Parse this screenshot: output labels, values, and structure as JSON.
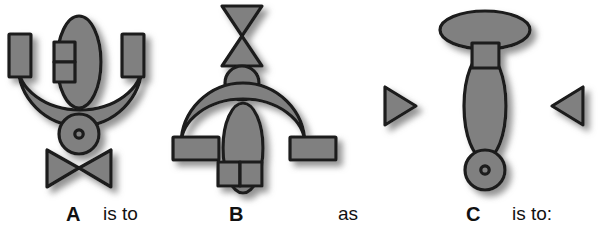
{
  "page": {
    "background_color": "#ffffff"
  },
  "style": {
    "shape_fill": "#808080",
    "shape_stroke": "#1a1a1a",
    "shadow_color": "#9a9a9a",
    "text_color": "#111111"
  },
  "captions": {
    "label_a": "A",
    "is_to_1": "is to",
    "label_b": "B",
    "as": "as",
    "label_c": "C",
    "is_to_2": "is to:"
  },
  "figures": [
    {
      "id": "A",
      "label": "A",
      "orientation": "upright",
      "parts": [
        {
          "name": "left-rectangle",
          "shape": "rectangle",
          "position": "upper-left"
        },
        {
          "name": "center-double-rectangle",
          "shape": "stacked-rectangles",
          "position": "upper-center-left",
          "count": 2
        },
        {
          "name": "vertical-ellipse",
          "shape": "ellipse",
          "position": "center",
          "orientation": "vertical"
        },
        {
          "name": "right-rectangle",
          "shape": "rectangle",
          "position": "upper-right"
        },
        {
          "name": "crescent-bowl",
          "shape": "crescent",
          "position": "middle",
          "opening": "up"
        },
        {
          "name": "ringed-circle",
          "shape": "circle-with-dot",
          "position": "below-center"
        },
        {
          "name": "bowtie",
          "shape": "bowtie",
          "position": "bottom",
          "orientation": "horizontal"
        }
      ]
    },
    {
      "id": "B",
      "label": "B",
      "orientation": "rotated-180",
      "parts": [
        {
          "name": "bowtie",
          "shape": "bowtie",
          "position": "top",
          "orientation": "vertical"
        },
        {
          "name": "plain-circle",
          "shape": "circle",
          "position": "upper-center"
        },
        {
          "name": "crescent-dome",
          "shape": "crescent",
          "position": "middle",
          "opening": "down"
        },
        {
          "name": "vertical-ellipse",
          "shape": "ellipse",
          "position": "center",
          "orientation": "vertical"
        },
        {
          "name": "left-rectangle",
          "shape": "rectangle",
          "position": "lower-left"
        },
        {
          "name": "right-rectangle",
          "shape": "rectangle",
          "position": "lower-right"
        },
        {
          "name": "center-double-rectangle",
          "shape": "side-by-side-rectangles",
          "position": "lower-center",
          "count": 2
        }
      ]
    },
    {
      "id": "C",
      "label": "C",
      "orientation": "rotated-90",
      "parts": [
        {
          "name": "horizontal-ellipse-cap",
          "shape": "ellipse",
          "position": "top",
          "orientation": "horizontal"
        },
        {
          "name": "center-square",
          "shape": "square",
          "position": "upper-center"
        },
        {
          "name": "vertical-ellipse",
          "shape": "ellipse",
          "position": "center",
          "orientation": "vertical"
        },
        {
          "name": "left-double-lobe",
          "shape": "double-lobe",
          "position": "left"
        },
        {
          "name": "right-double-lobe",
          "shape": "double-lobe",
          "position": "right"
        },
        {
          "name": "left-triangle",
          "shape": "triangle",
          "position": "far-left",
          "pointing": "right"
        },
        {
          "name": "right-triangle",
          "shape": "triangle",
          "position": "far-right",
          "pointing": "left"
        },
        {
          "name": "ringed-circle",
          "shape": "circle-with-dot",
          "position": "bottom"
        }
      ]
    }
  ]
}
